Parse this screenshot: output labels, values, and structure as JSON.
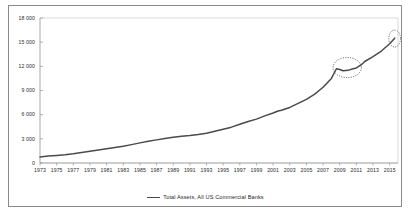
{
  "chart_data": {
    "type": "line",
    "title": "",
    "subtitle": "",
    "xlabel": "",
    "ylabel": "",
    "xlim": [
      1973,
      2016
    ],
    "ylim": [
      0,
      18000
    ],
    "grid": false,
    "legend_position": "bottom-center",
    "y_ticks": [
      "0",
      "3 000",
      "6 000",
      "9 000",
      "12 000",
      "15 000",
      "18 000"
    ],
    "y_tick_values": [
      0,
      3000,
      6000,
      9000,
      12000,
      15000,
      18000
    ],
    "x_ticks": [
      "1973",
      "1975",
      "1977",
      "1979",
      "1981",
      "1983",
      "1985",
      "1987",
      "1989",
      "1991",
      "1993",
      "1995",
      "1997",
      "1999",
      "2001",
      "2003",
      "2005",
      "2007",
      "2009",
      "2011",
      "2013",
      "2015"
    ],
    "x_tick_values": [
      1973,
      1975,
      1977,
      1979,
      1981,
      1983,
      1985,
      1987,
      1989,
      1991,
      1993,
      1995,
      1997,
      1999,
      2001,
      2003,
      2005,
      2007,
      2009,
      2011,
      2013,
      2015
    ],
    "series": [
      {
        "name": "Total Assets, All US Commercial Banks",
        "color": "#4a4a4a",
        "x": [
          1973,
          1974,
          1975,
          1976,
          1977,
          1978,
          1979,
          1980,
          1981,
          1982,
          1983,
          1984,
          1985,
          1986,
          1987,
          1988,
          1989,
          1990,
          1991,
          1992,
          1993,
          1994,
          1995,
          1996,
          1997,
          1998,
          1999,
          2000,
          2001,
          2001.6,
          2002,
          2003,
          2004,
          2005,
          2006,
          2007,
          2008,
          2008.6,
          2009,
          2009.4,
          2010,
          2010.6,
          2011,
          2011.6,
          2012,
          2013,
          2014,
          2015,
          2015.6
        ],
        "values": [
          760,
          860,
          940,
          1030,
          1150,
          1300,
          1450,
          1600,
          1770,
          1930,
          2080,
          2280,
          2500,
          2700,
          2870,
          3050,
          3200,
          3330,
          3400,
          3530,
          3700,
          3940,
          4200,
          4450,
          4800,
          5150,
          5450,
          5850,
          6200,
          6450,
          6550,
          6900,
          7400,
          7900,
          8550,
          9400,
          10500,
          11700,
          11600,
          11450,
          11500,
          11700,
          11800,
          12200,
          12600,
          13200,
          13900,
          14800,
          15500
        ],
        "marker": "none",
        "linewidth": 1.5
      }
    ],
    "annotations": [
      {
        "name": "plateau-ellipse",
        "shape": "ellipse",
        "style": "dotted",
        "color": "#4a4a4a",
        "x_range": [
          2008.2,
          2011.6
        ],
        "y_range": [
          10600,
          13100
        ],
        "label": ""
      },
      {
        "name": "endpoint-circle",
        "shape": "ellipse",
        "style": "dotted",
        "color": "#4a4a4a",
        "x_range": [
          2014.9,
          2016.3
        ],
        "y_range": [
          14400,
          16500
        ],
        "label": ""
      }
    ]
  },
  "legend": {
    "entries": [
      {
        "label": "Total Assets, All US Commercial Banks",
        "color": "#4a4a4a"
      }
    ]
  },
  "colors": {
    "line": "#4a4a4a",
    "axis": "#bfbfbf",
    "frame": "#8a8a8a",
    "tick_text": "#2b2b2b",
    "background": "#ffffff"
  }
}
